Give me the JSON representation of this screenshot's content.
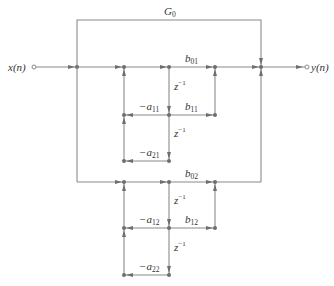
{
  "diagram": {
    "input_label": "x(n)",
    "output_label": "y(n)",
    "direct_gain": {
      "symbol": "G",
      "sub": "0"
    },
    "sections": [
      {
        "b0": {
          "symbol": "b",
          "sub": "01"
        },
        "b1": {
          "symbol": "b",
          "sub": "11"
        },
        "a1": {
          "symbol": "−a",
          "sub": "11"
        },
        "a2": {
          "symbol": "−a",
          "sub": "21"
        },
        "delay1": {
          "symbol": "z",
          "sup": "−1"
        },
        "delay2": {
          "symbol": "z",
          "sup": "−1"
        }
      },
      {
        "b0": {
          "symbol": "b",
          "sub": "02"
        },
        "b1": {
          "symbol": "b",
          "sub": "12"
        },
        "a1": {
          "symbol": "−a",
          "sub": "12"
        },
        "a2": {
          "symbol": "−a",
          "sub": "22"
        },
        "delay1": {
          "symbol": "z",
          "sup": "−1"
        },
        "delay2": {
          "symbol": "z",
          "sup": "−1"
        }
      }
    ],
    "colors": {
      "wire": "#8a8a8a",
      "node": "#6e6e6e",
      "text": "#333333"
    }
  }
}
